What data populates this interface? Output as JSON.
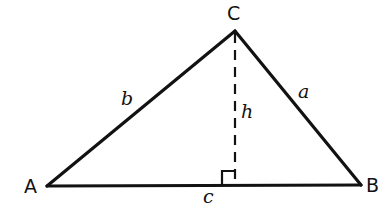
{
  "figure": {
    "kind": "geometry-diagram",
    "background_color": "#ffffff",
    "stroke_color": "#121212",
    "canvas": {
      "width": 391,
      "height": 218
    }
  },
  "labels": {
    "vertex_a": "A",
    "vertex_b": "B",
    "vertex_c": "C",
    "side_a": "a",
    "side_b": "b",
    "side_c": "c",
    "altitude_h": "h"
  },
  "geometry": {
    "vertices": {
      "A": {
        "x": 47,
        "y": 186
      },
      "B": {
        "x": 361,
        "y": 185
      },
      "C": {
        "x": 235,
        "y": 31
      }
    },
    "foot_of_altitude": {
      "x": 235,
      "y": 185
    },
    "edges": [
      {
        "name": "side-b",
        "from": "A",
        "to": "C",
        "style": "solid",
        "width": 3
      },
      {
        "name": "side-a",
        "from": "C",
        "to": "B",
        "style": "solid",
        "width": 3
      },
      {
        "name": "side-c",
        "from": "A",
        "to": "B",
        "style": "solid",
        "width": 3
      }
    ],
    "altitude": {
      "name": "altitude-h",
      "from": "C",
      "to": "foot_of_altitude",
      "style": "dashed",
      "width": 2,
      "dash_length": 10,
      "dash_gap": 7
    },
    "right_angle_marker": {
      "x": 222,
      "y": 171,
      "size": 14,
      "width": 2
    }
  }
}
